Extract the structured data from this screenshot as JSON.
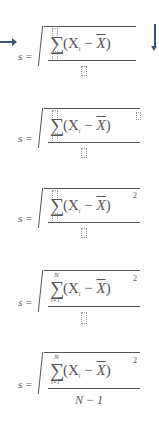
{
  "diagram": {
    "arrows": {
      "right": "arrow-right-icon",
      "down": "arrow-down-icon"
    },
    "colors": {
      "ink": "#555555",
      "arrow": "#3b5573",
      "placeholder": "#999999"
    },
    "steps": [
      {
        "lhs": "s =",
        "sigma": "∑",
        "upper": "",
        "lower": "",
        "base": "(X",
        "sub": "i",
        "mid": " − ",
        "xbar": "X",
        "close": ")",
        "power": "",
        "denominator": ""
      },
      {
        "lhs": "s =",
        "sigma": "∑",
        "upper": "",
        "lower": "",
        "base": "(X",
        "sub": "i",
        "mid": " − ",
        "xbar": "X",
        "close": ")",
        "power": "▯",
        "denominator": ""
      },
      {
        "lhs": "s =",
        "sigma": "∑",
        "upper": "",
        "lower": "",
        "base": "(X",
        "sub": "i",
        "mid": " − ",
        "xbar": "X",
        "close": ")",
        "power": "2",
        "denominator": ""
      },
      {
        "lhs": "s =",
        "sigma": "∑",
        "upper": "N",
        "lower": "i=1",
        "base": "(X",
        "sub": "i",
        "mid": " − ",
        "xbar": "X",
        "close": ")",
        "power": "2",
        "denominator": ""
      },
      {
        "lhs": "s =",
        "sigma": "∑",
        "upper": "N",
        "lower": "i=1",
        "base": "(X",
        "sub": "i",
        "mid": " − ",
        "xbar": "X",
        "close": ")",
        "power": "2",
        "denominator": "N − 1"
      }
    ]
  }
}
